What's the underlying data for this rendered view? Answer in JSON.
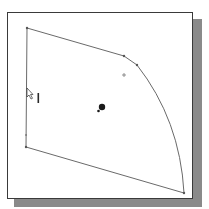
{
  "viewport": {
    "background": "#ffffff",
    "frame_border_color": "#3a3a3a",
    "shadow_color": "#8a8a8a"
  },
  "sketch": {
    "line_color": "#6a6a6a",
    "vertex_color": "#555555",
    "entities": [
      {
        "type": "line",
        "name": "top-edge",
        "from": [
          27,
          28
        ],
        "to": [
          124,
          56
        ]
      },
      {
        "type": "line",
        "name": "fillet-segment",
        "from": [
          124,
          56
        ],
        "to": [
          137,
          65
        ]
      },
      {
        "type": "arc",
        "name": "right-arc",
        "from": [
          137,
          65
        ],
        "to": [
          184,
          193
        ]
      },
      {
        "type": "line",
        "name": "bottom-edge",
        "from": [
          184,
          193
        ],
        "to": [
          26,
          147
        ]
      },
      {
        "type": "line",
        "name": "left-edge",
        "from": [
          26,
          147
        ],
        "to": [
          27,
          28
        ]
      }
    ],
    "vertices": [
      [
        27,
        28
      ],
      [
        124,
        56
      ],
      [
        137,
        65
      ],
      [
        184,
        193
      ],
      [
        26,
        147
      ],
      [
        26,
        135
      ]
    ],
    "center_mark": [
      124,
      75
    ],
    "origin": [
      102,
      108
    ]
  },
  "cursor": {
    "icon": "pointer-arrow-icon",
    "position": [
      27,
      88
    ],
    "vertical-relation-marker": [
      38,
      93,
      38,
      103
    ]
  }
}
